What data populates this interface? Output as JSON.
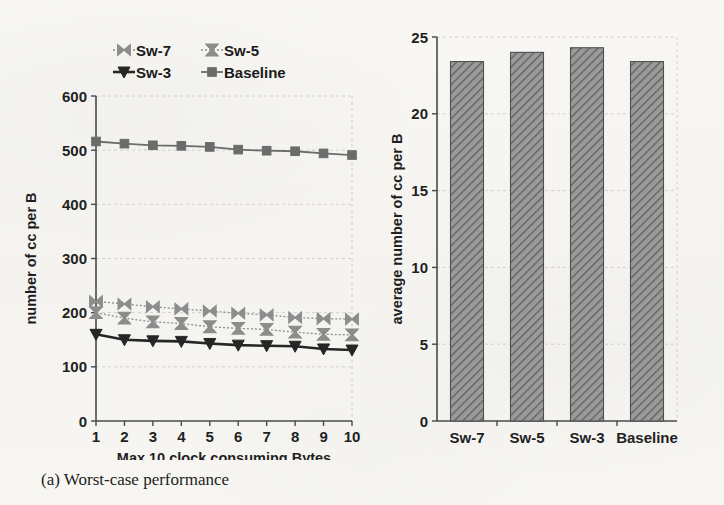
{
  "figure": {
    "captions": {
      "a": "(a) Worst-case performance",
      "b": "(b) Average-case Performance"
    }
  },
  "colors": {
    "baseline": "#6b6b6b",
    "sw3": "#262626",
    "sw5": "#8d8d8d",
    "sw7": "#8d8d8d",
    "bar_fill": "#8a8a8a",
    "bar_edge": "#4f4f4f",
    "axis": "#4a4a4a",
    "grid": "#c9c6c0",
    "text": "#1f1f1f",
    "page": "#f7f6f3"
  },
  "chart_data": [
    {
      "id": "worst-case",
      "type": "line",
      "title": "",
      "xlabel": "Max 10 clock consuming Bytes",
      "ylabel": "number of cc per B",
      "xlim": [
        1,
        10
      ],
      "ylim": [
        0,
        600
      ],
      "xticks": [
        1,
        2,
        3,
        4,
        5,
        6,
        7,
        8,
        9,
        10
      ],
      "yticks": [
        0,
        100,
        200,
        300,
        400,
        500,
        600
      ],
      "grid": true,
      "legend_position": "above-plot",
      "x": [
        1,
        2,
        3,
        4,
        5,
        6,
        7,
        8,
        9,
        10
      ],
      "series": [
        {
          "name": "Sw-7",
          "marker": "bowtie",
          "values": [
            221,
            216,
            211,
            207,
            203,
            199,
            196,
            191,
            189,
            188
          ]
        },
        {
          "name": "Sw-5",
          "marker": "x",
          "values": [
            200,
            190,
            183,
            180,
            174,
            171,
            169,
            164,
            160,
            159
          ]
        },
        {
          "name": "Sw-3",
          "marker": "triangle-down",
          "values": [
            160,
            150,
            148,
            147,
            143,
            140,
            139,
            138,
            133,
            131
          ]
        },
        {
          "name": "Baseline",
          "marker": "square",
          "values": [
            516,
            512,
            509,
            508,
            506,
            501,
            499,
            498,
            494,
            491
          ]
        }
      ]
    },
    {
      "id": "average-case",
      "type": "bar",
      "title": "",
      "xlabel": "",
      "ylabel": "average number of cc per B",
      "ylim": [
        0,
        25
      ],
      "yticks": [
        0,
        5,
        10,
        15,
        20,
        25
      ],
      "grid": true,
      "categories": [
        "Sw-7",
        "Sw-5",
        "Sw-3",
        "Baseline"
      ],
      "values": [
        23.4,
        24.0,
        24.3,
        23.4
      ]
    }
  ]
}
